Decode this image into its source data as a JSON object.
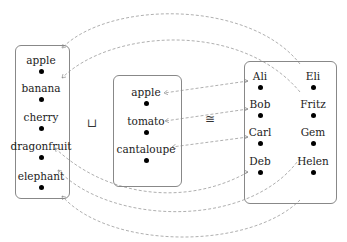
{
  "diagram": {
    "left_set": {
      "items": [
        "apple",
        "banana",
        "cherry",
        "dragonfruit",
        "elephant"
      ]
    },
    "middle_set": {
      "items": [
        "apple",
        "tomato",
        "cantaloupe"
      ]
    },
    "right_set": {
      "left_column": [
        "Ali",
        "Bob",
        "Carl",
        "Deb"
      ],
      "right_column": [
        "Eli",
        "Fritz",
        "Gem",
        "Helen"
      ]
    },
    "symbols": {
      "disjoint_union": "⊔",
      "isomorphic": "≅"
    },
    "arrows": [
      {
        "from": "Eli",
        "to": "apple (left)"
      },
      {
        "from": "Fritz",
        "to": "banana"
      },
      {
        "from": "Ali",
        "to": "apple (middle)"
      },
      {
        "from": "Bob",
        "to": "tomato"
      },
      {
        "from": "Carl",
        "to": "cantaloupe"
      },
      {
        "from": "Deb",
        "to": "dragonfruit"
      },
      {
        "from": "Gem",
        "to": "elephant"
      },
      {
        "from": "Helen",
        "to": "elephant (bottom)"
      }
    ],
    "colors": {
      "box_border": "#888888",
      "arrow": "#999999",
      "dot": "#000000"
    }
  }
}
